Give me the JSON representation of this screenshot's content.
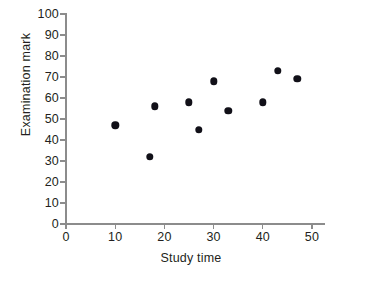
{
  "chart_data": {
    "type": "scatter",
    "title": "",
    "xlabel": "Study time",
    "ylabel": "Examination mark",
    "xlim": [
      0,
      50
    ],
    "ylim": [
      0,
      100
    ],
    "xticks": [
      0,
      10,
      20,
      30,
      40,
      50
    ],
    "yticks": [
      0,
      10,
      20,
      30,
      40,
      50,
      60,
      70,
      80,
      90,
      100
    ],
    "xtick_labels": [
      "0",
      "10",
      "20",
      "30",
      "40",
      "50"
    ],
    "ytick_labels": [
      "0",
      "10",
      "20",
      "30",
      "40",
      "50",
      "60",
      "70",
      "80",
      "90",
      "100"
    ],
    "grid": false,
    "legend": false,
    "marker_color": "#111018",
    "axis_color": "#8c8c8c",
    "points": [
      {
        "x": 10,
        "y": 47
      },
      {
        "x": 17,
        "y": 32
      },
      {
        "x": 18,
        "y": 56
      },
      {
        "x": 25,
        "y": 58
      },
      {
        "x": 27,
        "y": 45
      },
      {
        "x": 30,
        "y": 68
      },
      {
        "x": 33,
        "y": 54
      },
      {
        "x": 40,
        "y": 58
      },
      {
        "x": 43,
        "y": 73
      },
      {
        "x": 47,
        "y": 69
      }
    ]
  }
}
